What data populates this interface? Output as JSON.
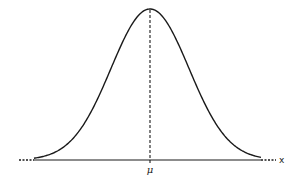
{
  "chart_data": {
    "type": "line",
    "title": "",
    "xlabel": "x",
    "ylabel": "",
    "mean_label": "μ",
    "distribution": "normal",
    "mean": 0,
    "std": 1,
    "xlim": [
      -3.4,
      3.4
    ],
    "ylim": [
      0,
      0.3989
    ],
    "grid": false,
    "series": [
      {
        "name": "density",
        "x": [
          -3.0,
          -2.5,
          -2.0,
          -1.5,
          -1.0,
          -0.5,
          0.0,
          0.5,
          1.0,
          1.5,
          2.0,
          2.5,
          3.0
        ],
        "values": [
          0.0044,
          0.0175,
          0.054,
          0.1295,
          0.242,
          0.3521,
          0.3989,
          0.3521,
          0.242,
          0.1295,
          0.054,
          0.0175,
          0.0044
        ]
      }
    ],
    "annotations": [
      {
        "type": "vertical-dashed-line",
        "at": 0,
        "label": "μ"
      },
      {
        "type": "dotted-axis-extension",
        "side": "left"
      },
      {
        "type": "dotted-axis-extension",
        "side": "right"
      }
    ],
    "colors": {
      "line": "#1a1a1a",
      "background": "#ffffff"
    }
  }
}
